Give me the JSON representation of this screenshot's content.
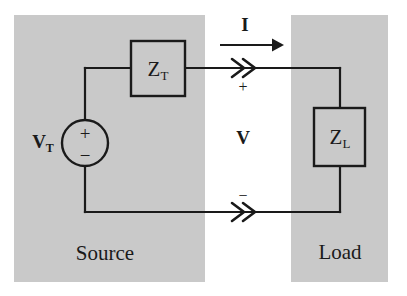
{
  "figure": {
    "type": "circuit-diagram",
    "width": 407,
    "height": 296,
    "background_color": "#ffffff",
    "shaded_region_color": "#c9c9c9",
    "line_color": "#1a1a1a"
  },
  "regions": {
    "source": {
      "label": "Source",
      "x": 14,
      "y": 15,
      "width": 191,
      "height": 267
    },
    "load": {
      "label": "Load",
      "x": 291,
      "y": 15,
      "width": 97,
      "height": 267
    }
  },
  "components": {
    "source_impedance": {
      "symbol": "Z",
      "subscript": "T",
      "name": "thevenin-impedance",
      "x": 131,
      "y": 41,
      "width": 54,
      "height": 55
    },
    "load_impedance": {
      "symbol": "Z",
      "subscript": "L",
      "name": "load-impedance",
      "x": 314,
      "y": 108,
      "width": 51,
      "height": 58
    },
    "voltage_source": {
      "symbol": "V",
      "subscript": "T",
      "name": "thevenin-voltage-source",
      "center_x": 85,
      "center_y": 143,
      "radius": 23,
      "plus_sign": "+",
      "minus_sign": "−"
    }
  },
  "annotations": {
    "current_label": "I",
    "current_label_x": 245,
    "current_label_y": 24,
    "voltage_label": "V",
    "voltage_label_x": 243,
    "voltage_label_y": 137,
    "terminal_plus": "+",
    "terminal_plus_x": 243,
    "terminal_plus_y": 87,
    "terminal_minus": "−",
    "terminal_minus_x": 243,
    "terminal_minus_y": 196,
    "current_arrow": {
      "x1": 220,
      "x2": 277,
      "y": 45
    },
    "top_wire_direction_marker": ">>",
    "bottom_wire_direction_marker": ">>"
  },
  "wires": {
    "top_y": 68,
    "bottom_y": 212,
    "left_x": 85,
    "right_x": 340,
    "source_box_left_x": 131,
    "source_box_right_x": 185
  }
}
